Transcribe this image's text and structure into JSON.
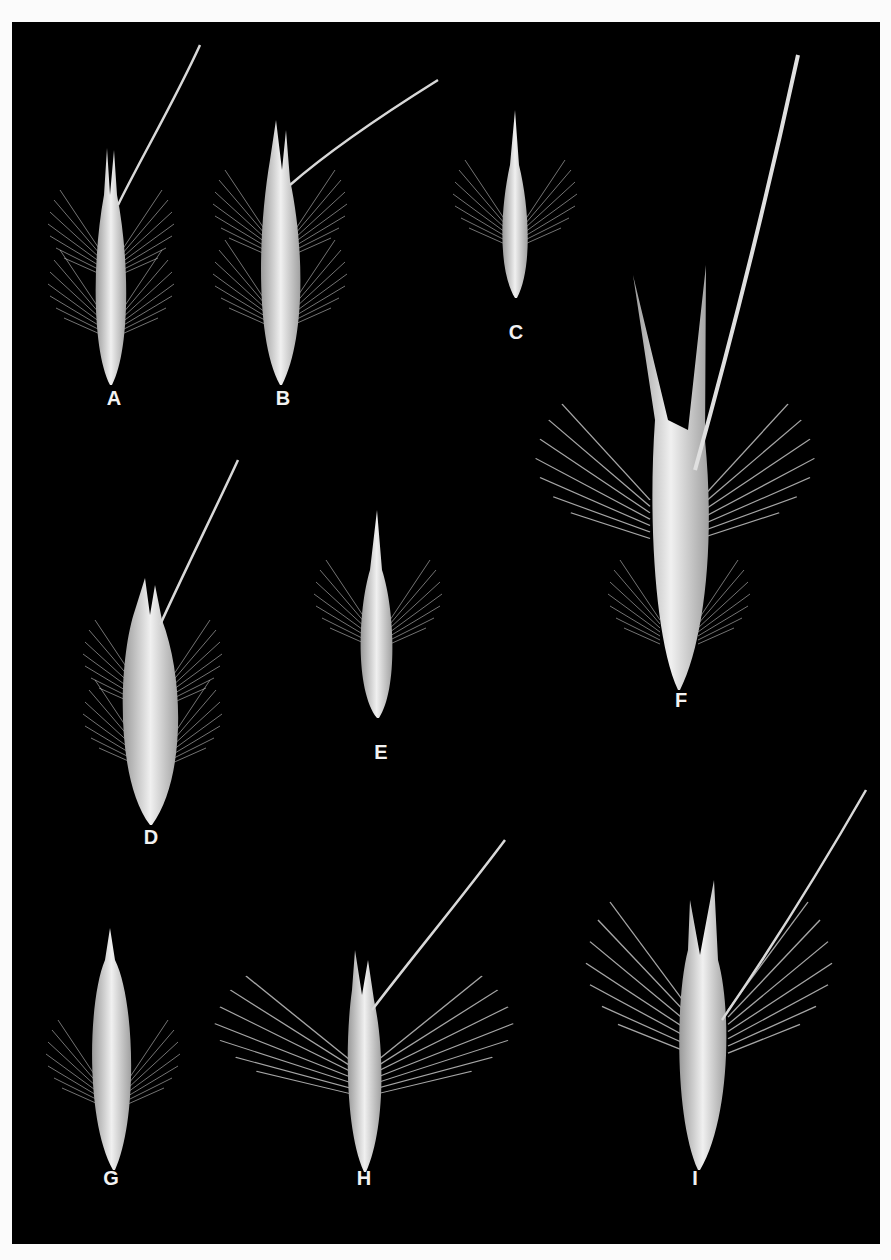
{
  "plate": {
    "background": "#000000",
    "specimen_color": "#e6e6e6",
    "specimens": [
      {
        "label": "A",
        "label_x": 99,
        "label_y": 388
      },
      {
        "label": "B",
        "label_x": 268,
        "label_y": 388
      },
      {
        "label": "C",
        "label_x": 501,
        "label_y": 322
      },
      {
        "label": "D",
        "label_x": 136,
        "label_y": 827
      },
      {
        "label": "E",
        "label_x": 366,
        "label_y": 742
      },
      {
        "label": "F",
        "label_x": 666,
        "label_y": 690
      },
      {
        "label": "G",
        "label_x": 96,
        "label_y": 1168
      },
      {
        "label": "H",
        "label_x": 349,
        "label_y": 1168
      },
      {
        "label": "I",
        "label_x": 680,
        "label_y": 1168
      }
    ]
  }
}
